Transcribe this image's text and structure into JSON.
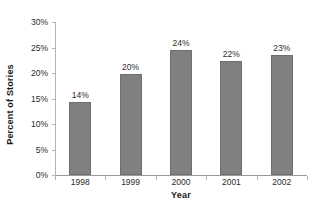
{
  "chart_data": {
    "type": "bar",
    "title": "",
    "subtitle": "",
    "xlabel": "Year",
    "ylabel": "Percent of Stories",
    "categories": [
      "1998",
      "1999",
      "2000",
      "2001",
      "2002"
    ],
    "values": [
      14,
      20,
      24,
      22,
      23
    ],
    "data_labels": [
      "14%",
      "20%",
      "24%",
      "22%",
      "23%"
    ],
    "plotted_values": [
      14.4,
      19.9,
      24.5,
      22.4,
      23.5
    ],
    "ylim": [
      0,
      30
    ],
    "ytick_values": [
      0,
      5,
      10,
      15,
      20,
      25,
      30
    ],
    "ytick_labels": [
      "0%",
      "5%",
      "10%",
      "15%",
      "20%",
      "25%",
      "30%"
    ],
    "grid": false,
    "legend": false,
    "legend_position": "none",
    "series": [
      {
        "name": "Percent of Stories",
        "values": [
          14,
          20,
          24,
          22,
          23
        ],
        "color": "#808080",
        "edge_color": "#6e6e6e"
      }
    ],
    "colors": {
      "bar_fill": "#808080",
      "bar_edge": "#6e6e6e",
      "axis_line": "#b4b4b4",
      "baseline": "#9a9a9a",
      "label_text": "#2b2b2b",
      "title_text": "#1a1a1a",
      "background": "#ffffff"
    }
  }
}
